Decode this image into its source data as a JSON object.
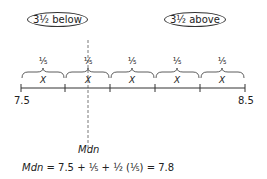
{
  "labels": {
    "below": "3½ below",
    "above": "3½ above",
    "left_end": "7.5",
    "right_end": "8.5",
    "median": "Mdn"
  },
  "segments": [
    {
      "fraction": "⅕",
      "var": "X"
    },
    {
      "fraction": "⅕",
      "var": "X"
    },
    {
      "fraction": "⅕",
      "var": "X"
    },
    {
      "fraction": "⅕",
      "var": "X"
    },
    {
      "fraction": "⅕",
      "var": "X"
    }
  ],
  "formula": {
    "lhs": "Mdn",
    "rhs": " = 7.5 + ⅕ + ½ (⅕) = 7.8"
  }
}
